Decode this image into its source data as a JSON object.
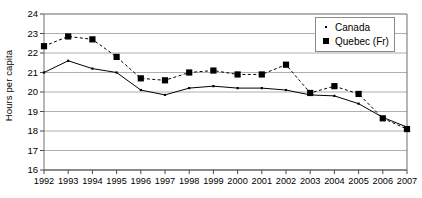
{
  "chart_data": {
    "type": "line",
    "title": "",
    "xlabel": "",
    "ylabel": "Hours per capita",
    "x": [
      1992,
      1993,
      1994,
      1995,
      1996,
      1997,
      1998,
      1999,
      2000,
      2001,
      2002,
      2003,
      2004,
      2005,
      2006,
      2007
    ],
    "categories": [
      "1992",
      "1993",
      "1994",
      "1995",
      "1996",
      "1997",
      "1998",
      "1999",
      "2000",
      "2001",
      "2002",
      "2003",
      "2004",
      "2005",
      "2006",
      "2007"
    ],
    "xlim": [
      1992,
      2007
    ],
    "ylim": [
      16,
      24
    ],
    "yticks": [
      16,
      17,
      18,
      19,
      20,
      21,
      22,
      23,
      24
    ],
    "ytick_labels": [
      "16",
      "17",
      "18",
      "19",
      "20",
      "21",
      "22",
      "23",
      "24"
    ],
    "grid": "horizontal",
    "legend_position": "top-right",
    "series": [
      {
        "name": "Canada",
        "marker": "dot",
        "line_style": "solid",
        "color": "#000000",
        "values": [
          21.0,
          21.6,
          21.2,
          21.0,
          20.1,
          19.85,
          20.2,
          20.3,
          20.2,
          20.2,
          20.1,
          19.85,
          19.8,
          19.4,
          18.7,
          18.2
        ]
      },
      {
        "name": "Quebec (Fr)",
        "marker": "square",
        "line_style": "dashed",
        "color": "#000000",
        "values": [
          22.35,
          22.85,
          22.7,
          21.8,
          20.7,
          20.6,
          21.0,
          21.1,
          20.9,
          20.9,
          21.4,
          19.95,
          20.3,
          19.9,
          18.65,
          18.1
        ]
      }
    ]
  },
  "legend": {
    "items": [
      {
        "label": "Canada",
        "marker": "dot"
      },
      {
        "label": "Quebec (Fr)",
        "marker": "square"
      }
    ]
  },
  "axes": {
    "y_axis_title": "Hours per capita"
  }
}
